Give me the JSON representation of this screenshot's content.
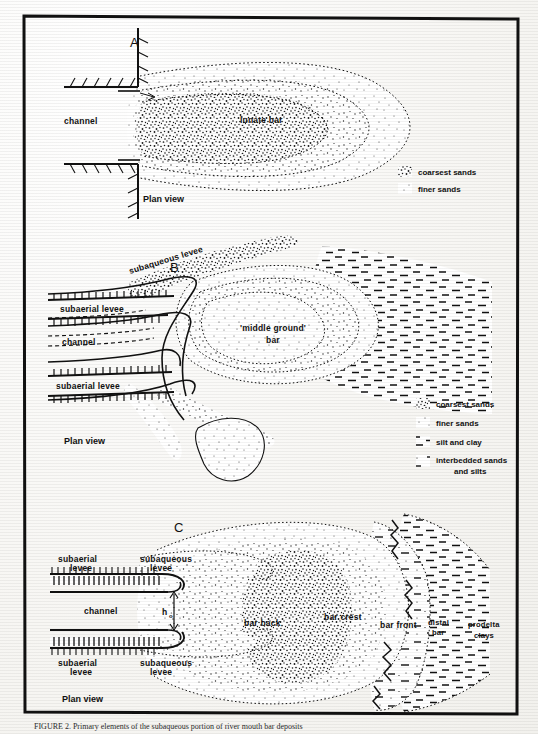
{
  "figure": {
    "caption": "FIGURE 2. Primary elements of the subaqueous portion of river mouth bar deposits",
    "frame_color": "#111111",
    "panels": [
      {
        "id": "A",
        "letter": "A",
        "plan_view_label": "Plan view",
        "labels": [
          {
            "name": "channel",
            "text": "channel"
          },
          {
            "name": "lunate-bar",
            "text": "lunate bar"
          }
        ],
        "legend": {
          "items": [
            {
              "symbol": "coarsest-sands-swatch",
              "text": "coarsest sands"
            },
            {
              "symbol": "finer-sands-swatch",
              "text": "finer sands"
            }
          ]
        }
      },
      {
        "id": "B",
        "letter": "B",
        "plan_view_label": "Plan view",
        "labels": [
          {
            "name": "subaqueous-levee",
            "text": "subaqueous levee"
          },
          {
            "name": "subaerial-levee-upper",
            "text": "subaerial levee"
          },
          {
            "name": "channel",
            "text": "channel"
          },
          {
            "name": "subaerial-levee-lower",
            "text": "subaerial levee"
          },
          {
            "name": "middle-ground-bar-line1",
            "text": "'middle ground'"
          },
          {
            "name": "middle-ground-bar-line2",
            "text": "bar"
          }
        ],
        "legend": {
          "items": [
            {
              "symbol": "coarsest-sands-swatch",
              "text": "coarsest sands"
            },
            {
              "symbol": "finer-sands-swatch",
              "text": "finer sands"
            },
            {
              "symbol": "silt-and-clay-swatch",
              "text": "silt and clay"
            },
            {
              "symbol": "interbedded-swatch",
              "text": "interbedded sands"
            },
            {
              "symbol": "interbedded-swatch-line2",
              "text": "and silts"
            }
          ]
        }
      },
      {
        "id": "C",
        "letter": "C",
        "plan_view_label": "Plan view",
        "labels": [
          {
            "name": "subaerial-levee-upper-line1",
            "text": "subaerial"
          },
          {
            "name": "subaerial-levee-upper-line2",
            "text": "levee"
          },
          {
            "name": "subaqueous-levee-upper-line1",
            "text": "subaqueous"
          },
          {
            "name": "subaqueous-levee-upper-line2",
            "text": "levee"
          },
          {
            "name": "channel",
            "text": "channel"
          },
          {
            "name": "depth-symbol",
            "text": "h"
          },
          {
            "name": "depth-symbol-subscript",
            "text": "o"
          },
          {
            "name": "subaerial-levee-lower-line1",
            "text": "subaerial"
          },
          {
            "name": "subaerial-levee-lower-line2",
            "text": "levee"
          },
          {
            "name": "subaqueous-levee-lower-line1",
            "text": "subaqueous"
          },
          {
            "name": "subaqueous-levee-lower-line2",
            "text": "levee"
          },
          {
            "name": "bar-back",
            "text": "bar back"
          },
          {
            "name": "bar-crest",
            "text": "bar crest"
          },
          {
            "name": "bar-front",
            "text": "bar front"
          },
          {
            "name": "distal-bar-line1",
            "text": "distal"
          },
          {
            "name": "distal-bar-line2",
            "text": "bar"
          },
          {
            "name": "prodelta-clays-line1",
            "text": "prodelta"
          },
          {
            "name": "prodelta-clays-line2",
            "text": "clays"
          }
        ]
      }
    ]
  }
}
